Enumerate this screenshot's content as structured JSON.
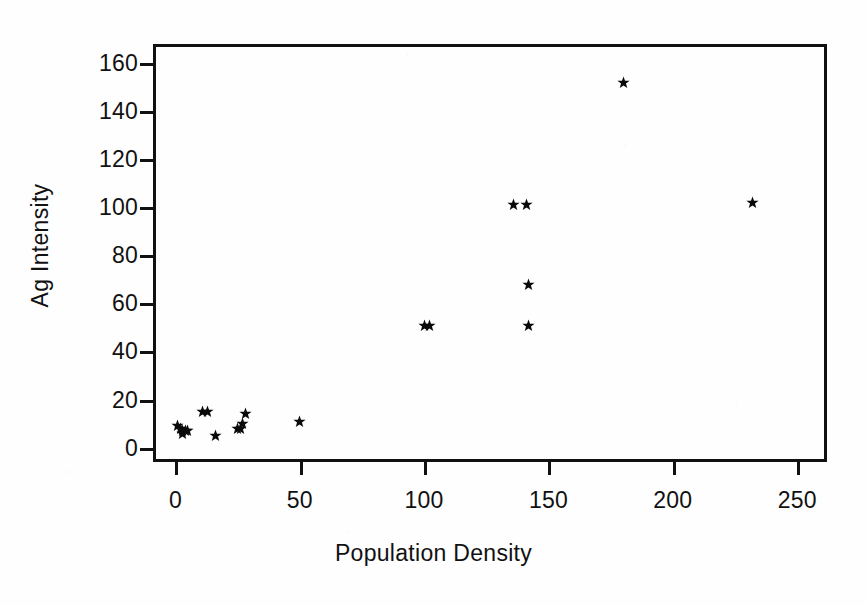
{
  "chart_data": {
    "type": "scatter",
    "title": "",
    "xlabel": "Population Density",
    "ylabel": "Ag Intensity",
    "xlim": [
      -9,
      262
    ],
    "ylim": [
      -6,
      168
    ],
    "grid": false,
    "legend": "none",
    "marker": "star",
    "marker_color": "#0a0a0a",
    "xticks": [
      0,
      50,
      100,
      150,
      200,
      250
    ],
    "xtick_labels": [
      "0",
      "50",
      "100",
      "150",
      "200",
      "250"
    ],
    "yticks": [
      0,
      20,
      40,
      60,
      80,
      100,
      120,
      140,
      160
    ],
    "ytick_labels": [
      "0",
      "20",
      "40",
      "60",
      "80",
      "100",
      "120",
      "140",
      "160"
    ],
    "x": [
      1,
      2,
      3,
      3,
      4,
      5,
      11,
      13,
      16,
      25,
      26,
      27,
      28,
      50,
      100,
      102,
      136,
      141,
      142,
      142,
      180,
      232
    ],
    "y": [
      9,
      8,
      7,
      6,
      7,
      7,
      15,
      15,
      5,
      8,
      8,
      10,
      14,
      11,
      51,
      51,
      101,
      101,
      68,
      51,
      152,
      102
    ],
    "points": [
      {
        "x": 1,
        "y": 9
      },
      {
        "x": 2,
        "y": 8
      },
      {
        "x": 3,
        "y": 7
      },
      {
        "x": 3,
        "y": 6
      },
      {
        "x": 4,
        "y": 7
      },
      {
        "x": 5,
        "y": 7
      },
      {
        "x": 11,
        "y": 15
      },
      {
        "x": 13,
        "y": 15
      },
      {
        "x": 16,
        "y": 5
      },
      {
        "x": 25,
        "y": 8
      },
      {
        "x": 26,
        "y": 8
      },
      {
        "x": 27,
        "y": 10
      },
      {
        "x": 28,
        "y": 14
      },
      {
        "x": 50,
        "y": 11
      },
      {
        "x": 100,
        "y": 51
      },
      {
        "x": 102,
        "y": 51
      },
      {
        "x": 136,
        "y": 101
      },
      {
        "x": 141,
        "y": 101
      },
      {
        "x": 142,
        "y": 68
      },
      {
        "x": 142,
        "y": 51
      },
      {
        "x": 180,
        "y": 152
      },
      {
        "x": 232,
        "y": 102
      }
    ]
  },
  "axes": {
    "x_title": "Population Density",
    "y_title": "Ag Intensity"
  }
}
